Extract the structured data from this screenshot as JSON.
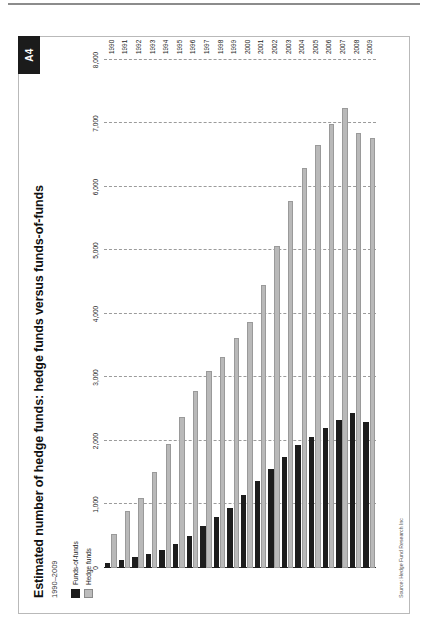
{
  "page": {
    "tab_label": "A4"
  },
  "figure": {
    "title": "Estimated number of hedge funds: hedge funds versus funds-of-funds",
    "subtitle": "1990–2009",
    "source": "Source: Hedge Fund Research Inc"
  },
  "legend": {
    "position": "top-left",
    "items": [
      {
        "label": "Funds-of-funds",
        "color": "#1d1d1d",
        "swatch": "funds-of-funds-swatch"
      },
      {
        "label": "Hedge funds",
        "color": "#b9b9b9",
        "swatch": "hedge-funds-swatch"
      }
    ]
  },
  "chart_data": {
    "type": "bar",
    "orientation": "horizontal",
    "title": "Estimated number of hedge funds: hedge funds versus funds-of-funds",
    "subtitle": "1990–2009",
    "xlabel": "",
    "ylabel": "",
    "xlim": [
      0,
      8000
    ],
    "xticks": [
      0,
      1000,
      2000,
      3000,
      4000,
      5000,
      6000,
      7000,
      8000
    ],
    "xtick_labels": [
      "0",
      "1,000",
      "2,000",
      "3,000",
      "4,000",
      "5,000",
      "6,000",
      "7,000",
      "8,000"
    ],
    "grid": true,
    "grid_style": "dashed-vertical",
    "legend_position": "top-left",
    "categories": [
      "1990",
      "1991",
      "1992",
      "1993",
      "1994",
      "1995",
      "1996",
      "1997",
      "1998",
      "1999",
      "2000",
      "2001",
      "2002",
      "2003",
      "2004",
      "2005",
      "2006",
      "2007",
      "2008",
      "2009"
    ],
    "series": [
      {
        "name": "Hedge funds",
        "color": "#b9b9b9",
        "values": [
          530,
          900,
          1105,
          1514,
          1945,
          2383,
          2781,
          3102,
          3325,
          3617,
          3873,
          4454,
          5065,
          5782,
          6297,
          6665,
          6990,
          7241,
          6845,
          6775
        ]
      },
      {
        "name": "Funds-of-funds",
        "color": "#1d1d1d",
        "values": [
          80,
          120,
          170,
          220,
          280,
          380,
          510,
          665,
          800,
          950,
          1150,
          1370,
          1560,
          1755,
          1930,
          2060,
          2200,
          2330,
          2440,
          2300
        ]
      }
    ]
  }
}
